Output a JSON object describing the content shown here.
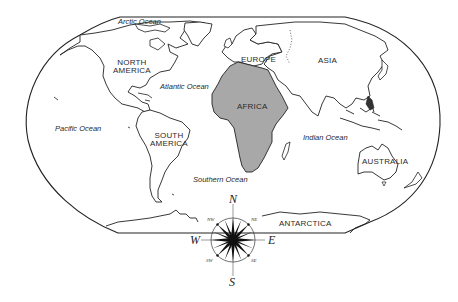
{
  "map": {
    "type": "world-political-outline",
    "colors": {
      "outline": "#222222",
      "africa_fill": "#a8a8a8",
      "land_fill": "#ffffff",
      "background": "#ffffff"
    },
    "continents": [
      {
        "id": "north-america",
        "label": "NORTH\nAMERICA",
        "highlighted": false
      },
      {
        "id": "south-america",
        "label": "SOUTH\nAMERICA",
        "highlighted": false
      },
      {
        "id": "europe",
        "label": "EUROPE",
        "highlighted": false
      },
      {
        "id": "asia",
        "label": "ASIA",
        "highlighted": false
      },
      {
        "id": "africa",
        "label": "AFRICA",
        "highlighted": true
      },
      {
        "id": "australia",
        "label": "AUSTRALIA",
        "highlighted": false
      },
      {
        "id": "antarctica",
        "label": "ANTARCTICA",
        "highlighted": false
      }
    ],
    "oceans": [
      {
        "id": "arctic",
        "label": "Arctic Ocean"
      },
      {
        "id": "atlantic",
        "label": "Atlantic Ocean"
      },
      {
        "id": "pacific",
        "label": "Pacific Ocean"
      },
      {
        "id": "indian",
        "label": "Indian Ocean"
      },
      {
        "id": "southern",
        "label": "Southern Ocean"
      }
    ],
    "compass": {
      "north": "N",
      "south": "S",
      "east": "E",
      "west": "W",
      "northwest": "NW",
      "northeast": "NE",
      "southwest": "SW",
      "southeast": "SE"
    }
  }
}
